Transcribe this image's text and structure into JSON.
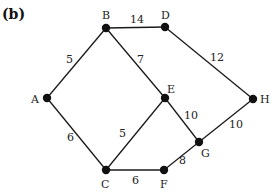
{
  "figure": {
    "title": "(b)"
  },
  "nodes": [
    {
      "id": "A",
      "x": 47,
      "y": 98,
      "label": "A",
      "lx": 31,
      "ly": 103
    },
    {
      "id": "B",
      "x": 106,
      "y": 28,
      "label": "B",
      "lx": 102,
      "ly": 19
    },
    {
      "id": "C",
      "x": 106,
      "y": 170,
      "label": "C",
      "lx": 101,
      "ly": 188
    },
    {
      "id": "D",
      "x": 165,
      "y": 27,
      "label": "D",
      "lx": 161,
      "ly": 19
    },
    {
      "id": "E",
      "x": 165,
      "y": 98,
      "label": "E",
      "lx": 167,
      "ly": 93
    },
    {
      "id": "F",
      "x": 164,
      "y": 170,
      "label": "F",
      "lx": 160,
      "ly": 188
    },
    {
      "id": "G",
      "x": 199,
      "y": 142,
      "label": "G",
      "lx": 201,
      "ly": 157
    },
    {
      "id": "H",
      "x": 253,
      "y": 99,
      "label": "H",
      "lx": 260,
      "ly": 103
    }
  ],
  "edges": [
    {
      "from": "A",
      "to": "B",
      "weight": "5",
      "wx": 66,
      "wy": 63
    },
    {
      "from": "A",
      "to": "C",
      "weight": "6",
      "wx": 67,
      "wy": 141
    },
    {
      "from": "B",
      "to": "D",
      "weight": "14",
      "wx": 130,
      "wy": 23
    },
    {
      "from": "B",
      "to": "E",
      "weight": "7",
      "wx": 137,
      "wy": 63
    },
    {
      "from": "D",
      "to": "H",
      "weight": "12",
      "wx": 210,
      "wy": 61
    },
    {
      "from": "C",
      "to": "E",
      "weight": "5",
      "wx": 119,
      "wy": 137
    },
    {
      "from": "C",
      "to": "F",
      "weight": "6",
      "wx": 132,
      "wy": 184
    },
    {
      "from": "E",
      "to": "G",
      "weight": "10",
      "wx": 184,
      "wy": 119
    },
    {
      "from": "G",
      "to": "H",
      "weight": "10",
      "wx": 229,
      "wy": 128
    },
    {
      "from": "F",
      "to": "G",
      "weight": "8",
      "wx": 179,
      "wy": 164
    }
  ]
}
